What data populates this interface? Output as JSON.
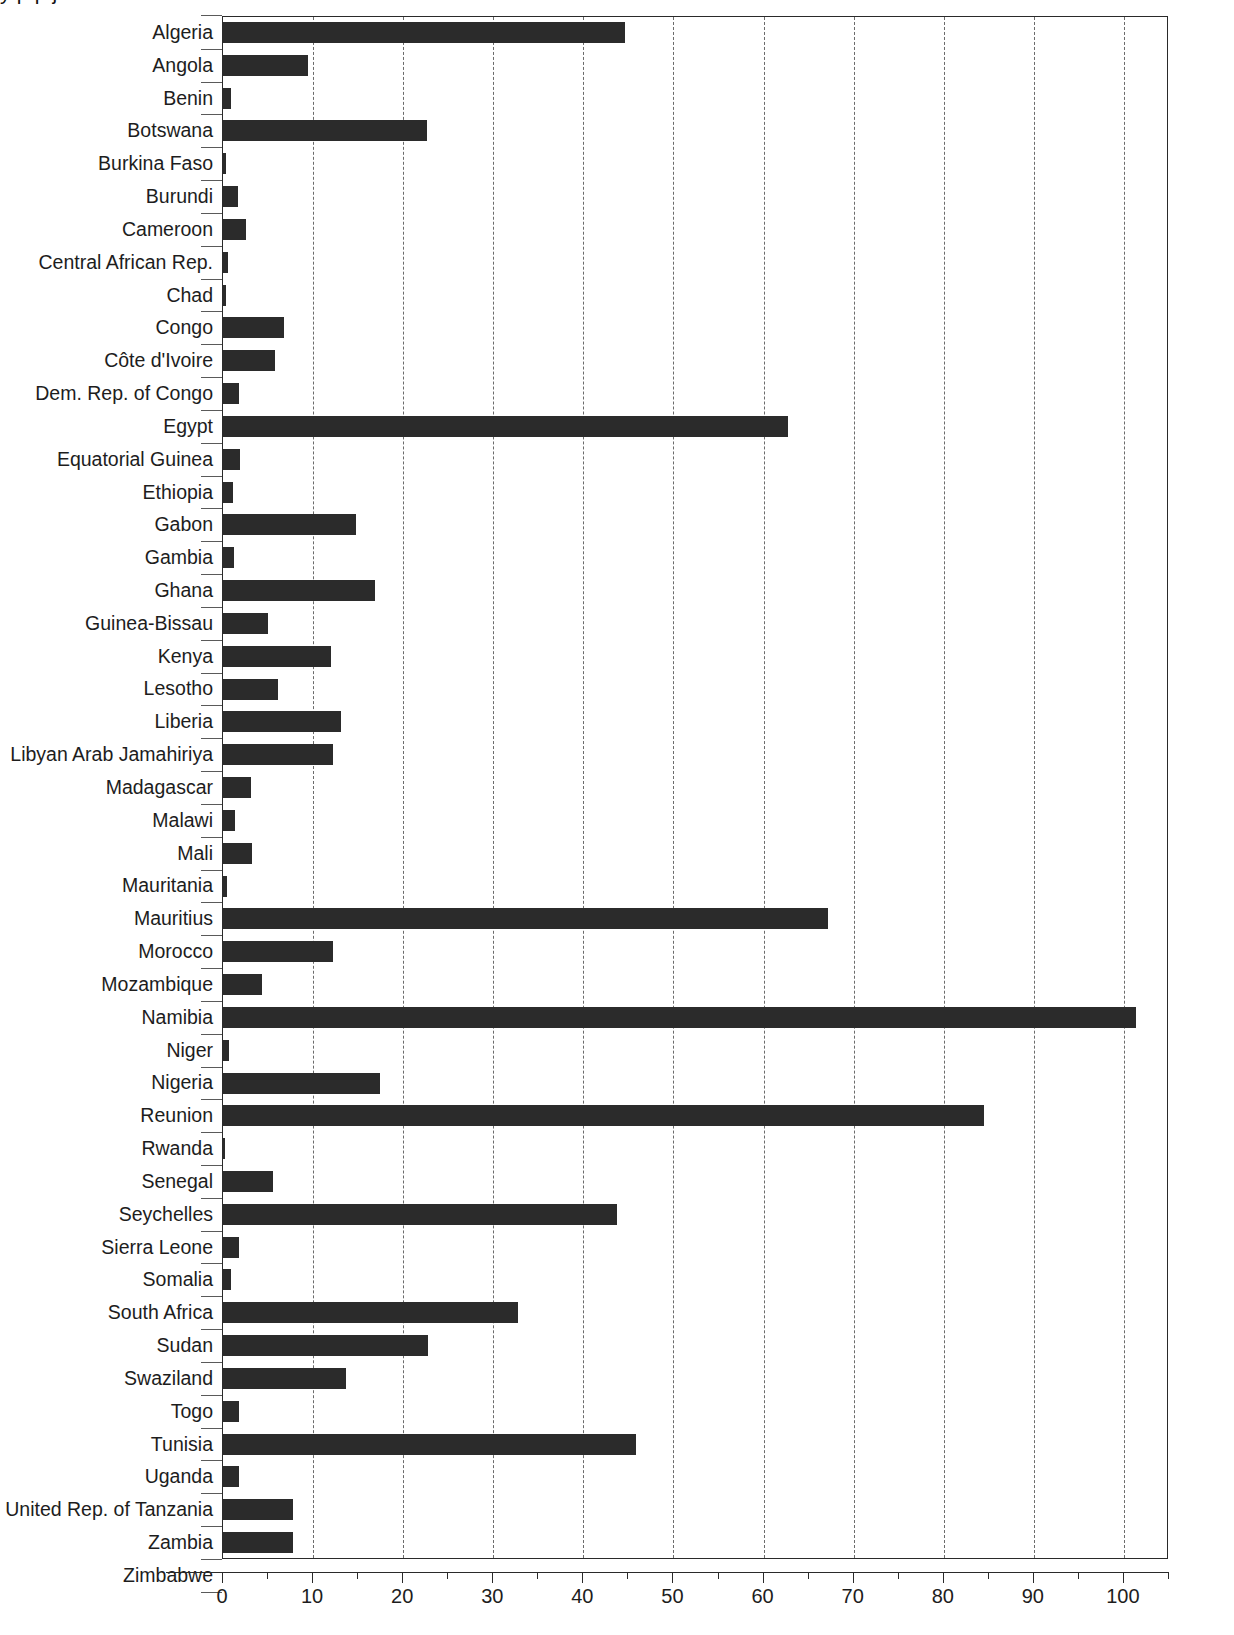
{
  "title_partial": "y  p  p         j",
  "chart_data": {
    "type": "bar",
    "orientation": "horizontal",
    "title": "",
    "xlabel": "",
    "ylabel": "",
    "xlim": [
      0,
      105
    ],
    "xticks": [
      0,
      10,
      20,
      30,
      40,
      50,
      60,
      70,
      80,
      90,
      100
    ],
    "xticklabels": [
      "0",
      "10",
      "20",
      "30",
      "40",
      "50",
      "60",
      "70",
      "80",
      "90",
      "100"
    ],
    "grid": "vertical-dashed",
    "legend": "none",
    "bar_color": "#2b2b2b",
    "categories": [
      "Algeria",
      "Angola",
      "Benin",
      "Botswana",
      "Burkina Faso",
      "Burundi",
      "Cameroon",
      "Central African Rep.",
      "Chad",
      "Congo",
      "Côte d'Ivoire",
      "Dem. Rep. of Congo",
      "Egypt",
      "Equatorial Guinea",
      "Ethiopia",
      "Gabon",
      "Gambia",
      "Ghana",
      "Guinea-Bissau",
      "Kenya",
      "Lesotho",
      "Liberia",
      "Libyan Arab Jamahiriya",
      "Madagascar",
      "Malawi",
      "Mali",
      "Mauritania",
      "Mauritius",
      "Morocco",
      "Mozambique",
      "Namibia",
      "Niger",
      "Nigeria",
      "Reunion",
      "Rwanda",
      "Senegal",
      "Seychelles",
      "Sierra Leone",
      "Somalia",
      "South Africa",
      "Sudan",
      "Swaziland",
      "Togo",
      "Tunisia",
      "Uganda",
      "United Rep. of Tanzania",
      "Zambia",
      "Zimbabwe"
    ],
    "values": [
      44.6,
      9.4,
      0.9,
      22.6,
      0.3,
      1.7,
      2.6,
      0.5,
      0.3,
      6.8,
      5.8,
      1.8,
      62.7,
      1.9,
      1.1,
      14.8,
      1.2,
      16.9,
      5.0,
      12.0,
      6.1,
      13.1,
      12.2,
      3.1,
      1.3,
      3.2,
      0.4,
      67.2,
      12.2,
      4.3,
      101.3,
      0.7,
      17.4,
      84.5,
      0.15,
      5.5,
      43.7,
      1.8,
      0.9,
      32.7,
      22.7,
      13.7,
      1.8,
      45.8,
      1.8,
      7.8,
      7.8,
      17.9
    ]
  }
}
